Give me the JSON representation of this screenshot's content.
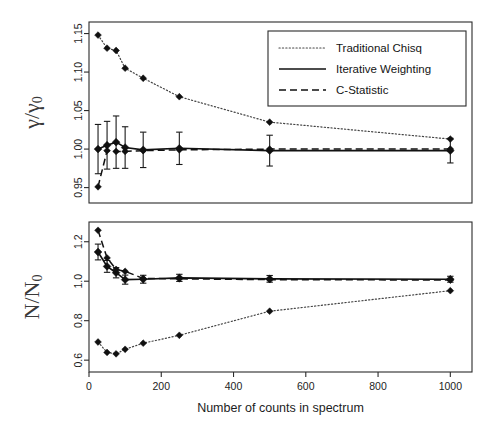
{
  "figure": {
    "xlabel": "Number of counts in spectrum",
    "panels": [
      {
        "id": "gamma-panel",
        "ylabel_main": "γ/γ",
        "ylabel_sub": "0",
        "ytick_labels": [
          "0.95",
          "1.00",
          "1.05",
          "1.10",
          "1.15"
        ],
        "ytick_values": [
          0.95,
          1.0,
          1.05,
          1.1,
          1.15
        ]
      },
      {
        "id": "counts-panel",
        "ylabel_main": "N/N",
        "ylabel_sub": "0",
        "ytick_labels": [
          "0.6",
          "0.8",
          "1.0",
          "1.2"
        ],
        "ytick_values": [
          0.6,
          0.8,
          1.0,
          1.2
        ]
      }
    ],
    "xtick_labels": [
      "0",
      "200",
      "400",
      "600",
      "800",
      "1000"
    ],
    "xtick_values": [
      0,
      200,
      400,
      600,
      800,
      1000
    ],
    "legend": {
      "position": "top-right",
      "entries": [
        {
          "label": "Traditional Chisq",
          "style": "dotted"
        },
        {
          "label": "Iterative Weighting",
          "style": "solid"
        },
        {
          "label": "C-Statistic",
          "style": "dashed"
        }
      ]
    }
  },
  "chart_data": {
    "type": "line",
    "title": "",
    "xlabel": "Number of counts in spectrum",
    "xlim": [
      0,
      1060
    ],
    "grid": false,
    "legend_position": "top-right",
    "x": [
      25,
      50,
      75,
      100,
      150,
      250,
      500,
      1000
    ],
    "panels": [
      {
        "name": "gamma-panel",
        "ylabel": "γ/γ₀",
        "ylim": [
          0.93,
          1.165
        ],
        "series": [
          {
            "name": "Traditional Chisq",
            "style": "dotted",
            "values": [
              1.148,
              1.131,
              1.128,
              1.105,
              1.092,
              1.068,
              1.035,
              1.013
            ],
            "errors": [
              0,
              0,
              0,
              0,
              0,
              0,
              0,
              0
            ]
          },
          {
            "name": "Iterative Weighting",
            "style": "solid",
            "values": [
              1.0,
              1.005,
              1.009,
              1.002,
              0.999,
              1.001,
              0.998,
              0.998
            ],
            "errors": [
              0.032,
              0.031,
              0.034,
              0.027,
              0.023,
              0.021,
              0.02,
              0.016
            ]
          },
          {
            "name": "C-Statistic",
            "style": "dashed",
            "values": [
              0.951,
              0.998,
              0.997,
              0.997,
              0.998,
              0.999,
              1.0,
              1.0
            ],
            "errors": [
              0,
              0,
              0,
              0,
              0,
              0,
              0,
              0
            ]
          }
        ]
      },
      {
        "name": "counts-panel",
        "ylabel": "N/N₀",
        "ylim": [
          0.54,
          1.3
        ],
        "series": [
          {
            "name": "Traditional Chisq",
            "style": "dotted",
            "values": [
              0.692,
              0.639,
              0.632,
              0.655,
              0.686,
              0.726,
              0.848,
              0.952
            ],
            "errors": [
              0,
              0,
              0,
              0,
              0,
              0,
              0,
              0
            ]
          },
          {
            "name": "Iterative Weighting",
            "style": "solid",
            "values": [
              1.148,
              1.075,
              1.043,
              1.008,
              1.01,
              1.017,
              1.012,
              1.01
            ],
            "errors": [
              0.04,
              0.03,
              0.026,
              0.023,
              0.02,
              0.018,
              0.017,
              0.015
            ]
          },
          {
            "name": "C-Statistic",
            "style": "dashed",
            "values": [
              1.258,
              1.118,
              1.06,
              1.05,
              1.014,
              1.012,
              1.008,
              1.006
            ],
            "errors": [
              0,
              0,
              0,
              0,
              0,
              0,
              0,
              0
            ]
          }
        ]
      }
    ]
  }
}
